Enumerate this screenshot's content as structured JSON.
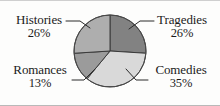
{
  "figure": {
    "background_color": "#fdfdfc",
    "text_color": "#1b1b1b"
  },
  "chart_data": {
    "type": "pie",
    "title": "",
    "subtitle": "",
    "xlabel": "",
    "ylabel": "",
    "legend_position": "none",
    "grid": false,
    "labels_position": "outside-corners-with-leader-lines",
    "start_angle_deg": 0,
    "direction": "clockwise",
    "units": "percent",
    "total": 100,
    "categories": [
      "Tragedies",
      "Comedies",
      "Romances",
      "Histories"
    ],
    "values": [
      26,
      35,
      13,
      26
    ],
    "slices": [
      {
        "label": "Tragedies",
        "value": 26,
        "value_text": "26%",
        "color": "#828282",
        "start_angle_deg": 0,
        "end_angle_deg": 93.6
      },
      {
        "label": "Comedies",
        "value": 35,
        "value_text": "35%",
        "color": "#d9d9d9",
        "start_angle_deg": 93.6,
        "end_angle_deg": 219.6
      },
      {
        "label": "Romances",
        "value": 13,
        "value_text": "13%",
        "color": "#9b9b9b",
        "start_angle_deg": 219.6,
        "end_angle_deg": 266.4
      },
      {
        "label": "Histories",
        "value": 26,
        "value_text": "26%",
        "color": "#aeaeae",
        "start_angle_deg": 266.4,
        "end_angle_deg": 360
      }
    ]
  },
  "labels": {
    "histories": {
      "name": "Histories",
      "percent": "26%"
    },
    "tragedies": {
      "name": "Tragedies",
      "percent": "26%"
    },
    "romances": {
      "name": "Romances",
      "percent": "13%"
    },
    "comedies": {
      "name": "Comedies",
      "percent": "35%"
    }
  }
}
